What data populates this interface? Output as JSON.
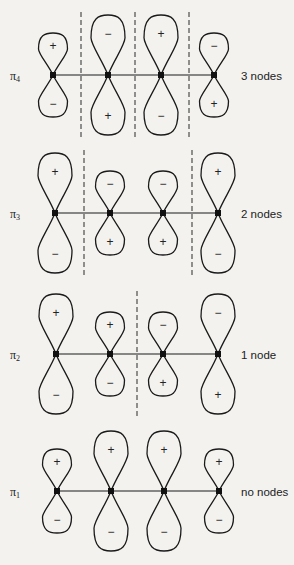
{
  "figure": {
    "colors": {
      "ink": "#1a1a1a",
      "background": "#f3f2ef"
    },
    "rows": [
      {
        "id": "pi4",
        "symbol": "π",
        "subscript": "4",
        "node_label": "3 nodes",
        "center_y": 75,
        "atoms_x": [
          53,
          108,
          161,
          214
        ],
        "lobe_sizes": [
          "small",
          "big",
          "big",
          "small"
        ],
        "top_signs": [
          "+",
          "−",
          "+",
          "−"
        ],
        "bottom_signs": [
          "−",
          "+",
          "−",
          "+"
        ],
        "node_lines_x": [
          81,
          135,
          189
        ]
      },
      {
        "id": "pi3",
        "symbol": "π",
        "subscript": "3",
        "node_label": "2 nodes",
        "center_y": 213,
        "atoms_x": [
          55,
          110,
          163,
          218
        ],
        "lobe_sizes": [
          "big",
          "small",
          "small",
          "big"
        ],
        "top_signs": [
          "+",
          "−",
          "−",
          "+"
        ],
        "bottom_signs": [
          "−",
          "+",
          "+",
          "−"
        ],
        "node_lines_x": [
          84,
          192
        ]
      },
      {
        "id": "pi2",
        "symbol": "π",
        "subscript": "2",
        "node_label": "1 node",
        "center_y": 354,
        "atoms_x": [
          56,
          110,
          163,
          218
        ],
        "lobe_sizes": [
          "big",
          "small",
          "small",
          "big"
        ],
        "top_signs": [
          "+",
          "+",
          "−",
          "−"
        ],
        "bottom_signs": [
          "−",
          "−",
          "+",
          "+"
        ],
        "node_lines_x": [
          137
        ]
      },
      {
        "id": "pi1",
        "symbol": "π",
        "subscript": "1",
        "node_label": "no nodes",
        "center_y": 491,
        "atoms_x": [
          57,
          111,
          164,
          219
        ],
        "lobe_sizes": [
          "small",
          "big",
          "big",
          "small"
        ],
        "top_signs": [
          "+",
          "+",
          "+",
          "+"
        ],
        "bottom_signs": [
          "−",
          "−",
          "−",
          "−"
        ],
        "node_lines_x": []
      }
    ]
  }
}
